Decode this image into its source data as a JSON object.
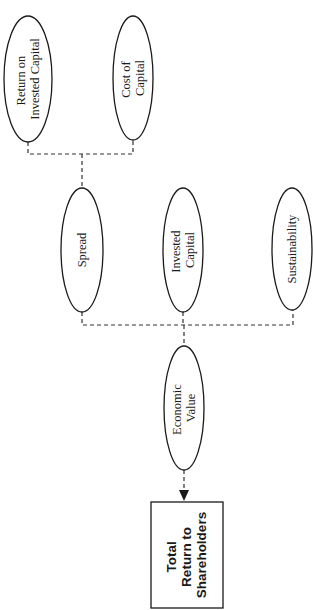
{
  "diagram": {
    "orientation": "rotated-90-ccw",
    "nodes": {
      "roic": {
        "lines": [
          "Return on",
          "Invested Capital"
        ],
        "shape": "ellipse"
      },
      "coc": {
        "lines": [
          "Cost of",
          "Capital"
        ],
        "shape": "ellipse"
      },
      "spread": {
        "lines": [
          "Spread"
        ],
        "shape": "ellipse"
      },
      "ic": {
        "lines": [
          "Invested",
          "Capital"
        ],
        "shape": "ellipse"
      },
      "sust": {
        "lines": [
          "Sustainability"
        ],
        "shape": "ellipse"
      },
      "ev": {
        "lines": [
          "Economic",
          "Value"
        ],
        "shape": "ellipse"
      },
      "tsr": {
        "lines": [
          "Total",
          "Return to",
          "Shareholders"
        ],
        "shape": "rectangle"
      }
    },
    "edges": [
      {
        "from": [
          "roic",
          "coc"
        ],
        "to": "spread",
        "style": "dashed"
      },
      {
        "from": [
          "spread",
          "ic",
          "sust"
        ],
        "to": "ev",
        "style": "dashed"
      },
      {
        "from": [
          "ev"
        ],
        "to": "tsr",
        "style": "dashed-arrow"
      }
    ],
    "colors": {
      "stroke": "#1a1a1a",
      "connector": "#333333",
      "background": "#ffffff"
    }
  }
}
